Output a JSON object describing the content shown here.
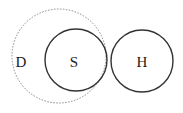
{
  "diagram": {
    "circles": [
      {
        "id": "D",
        "label": "D",
        "style": "dotted",
        "cx": 59,
        "cy": 56,
        "r": 47,
        "label_x": 21,
        "label_y": 67
      },
      {
        "id": "S",
        "label": "S",
        "style": "solid",
        "cx": 76,
        "cy": 60,
        "r": 31,
        "label_x": 74,
        "label_y": 67
      },
      {
        "id": "H",
        "label": "H",
        "style": "solid",
        "cx": 142,
        "cy": 61,
        "r": 31,
        "label_x": 142,
        "label_y": 67
      }
    ],
    "colors": {
      "solid": "#333333",
      "dotted": "#888888"
    }
  }
}
